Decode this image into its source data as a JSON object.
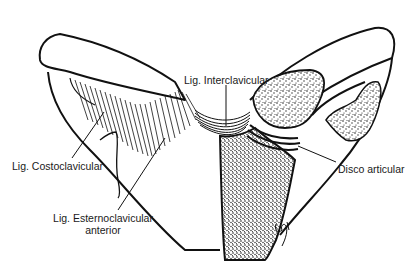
{
  "diagram": {
    "labels": {
      "interclavicular": "Lig. Interclavicular",
      "costoclavicular": "Lig. Costoclavicular",
      "sternoclavicular_anterior_line1": "Lig. Esternoclavicular",
      "sternoclavicular_anterior_line2": "anterior",
      "articular_disc": "Disco articular"
    },
    "colors": {
      "ink": "#111111",
      "background": "#ffffff",
      "stipple": "#222222"
    }
  }
}
